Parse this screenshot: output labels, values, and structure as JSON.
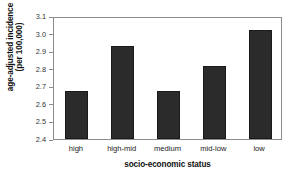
{
  "chart_data": {
    "type": "bar",
    "title": "",
    "categories": [
      "high",
      "high-mid",
      "medium",
      "mid-low",
      "low"
    ],
    "values": [
      2.675,
      2.94,
      2.675,
      2.825,
      3.03
    ],
    "xlabel": "socio-economic status",
    "ylabel_line1": "age-adjusted incidence",
    "ylabel_line2": "(per 100,000)",
    "ylabel": "age-adjusted incidence (per 100,000)",
    "ylim": [
      2.4,
      3.1
    ],
    "ytick_labels": [
      "3.1",
      "3.0",
      "2.9",
      "2.8",
      "2.7",
      "2.6",
      "2.5",
      "2.4"
    ],
    "ytick_values": [
      3.1,
      3.0,
      2.9,
      2.8,
      2.7,
      2.6,
      2.5,
      2.4
    ],
    "ytick_step": 0.1,
    "grid": false,
    "legend": false,
    "bar_color": "#2b2b2b",
    "frame_color": "#8c8c8c",
    "background_color": "#ffffff"
  }
}
